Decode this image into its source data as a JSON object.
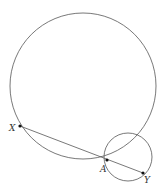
{
  "diagram": {
    "type": "geometry",
    "stroke_color": "#555555",
    "point_color": "#111111",
    "circles": [
      {
        "name": "large-circle",
        "cx": 83,
        "cy": 86,
        "r": 73
      },
      {
        "name": "small-circle",
        "cx": 128,
        "cy": 157,
        "r": 24
      }
    ],
    "segments": [
      {
        "name": "segment-XY",
        "from": "X",
        "to": "Y"
      }
    ],
    "points": [
      {
        "name": "X",
        "label": "X",
        "x": 20,
        "y": 126,
        "label_x": 9,
        "label_y": 131
      },
      {
        "name": "A",
        "label": "A",
        "x": 107,
        "y": 160,
        "label_x": 100,
        "label_y": 172
      },
      {
        "name": "Y",
        "label": "Y",
        "x": 143,
        "y": 173,
        "label_x": 144,
        "label_y": 183
      }
    ]
  }
}
